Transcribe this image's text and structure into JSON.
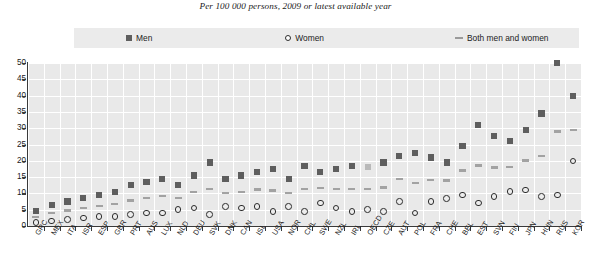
{
  "header": {
    "title": "Suicide rates by gender",
    "subtitle": "Per 100 000 persons, 2009 or latest available year"
  },
  "legend": {
    "men": "Men",
    "women": "Women",
    "both": "Both men and women"
  },
  "colors": {
    "men": "#5e5e5e",
    "men_highlight": "#b9b9b9",
    "women_stroke": "#2b2b2b",
    "both": "#a2a2a2",
    "plot_background": "#e9e9e9",
    "gridline": "#ffffff",
    "axis": "#3a3a3a",
    "legend_background": "#ebebeb"
  },
  "chart_data": {
    "type": "scatter",
    "title": "Suicide rates by gender",
    "subtitle": "Per 100 000 persons, 2009 or latest available year",
    "xlabel": "",
    "ylabel": "",
    "ylim": [
      0,
      50
    ],
    "yticks": [
      0,
      5,
      10,
      15,
      20,
      25,
      30,
      35,
      40,
      45,
      50
    ],
    "grid": true,
    "legend_position": "top",
    "highlight_category": "OECD",
    "categories": [
      "GRC",
      "MEX",
      "ITA",
      "ISR",
      "ESP",
      "GBR",
      "PRT",
      "AUS",
      "LUX",
      "NLD",
      "DEU",
      "SVK",
      "DNK",
      "CAN",
      "ISL",
      "USA",
      "NOR",
      "CHL",
      "SWE",
      "NZL",
      "IRL",
      "OECD",
      "CZE",
      "AUT",
      "POL",
      "FRA",
      "CHE",
      "BEL",
      "EST",
      "SVN",
      "FIN",
      "JPN",
      "HUN",
      "RUS",
      "KOR"
    ],
    "series": [
      {
        "name": "Men",
        "marker": "square",
        "values": [
          4.5,
          6.5,
          7.5,
          8.5,
          9.5,
          10.5,
          12.5,
          13.5,
          14.5,
          12.5,
          15.5,
          19.5,
          14.5,
          15.5,
          16.5,
          17.5,
          14.5,
          18.5,
          16.5,
          17.5,
          18.5,
          18.0,
          19.5,
          21.5,
          22.5,
          21.0,
          19.5,
          24.5,
          31.0,
          27.5,
          26.0,
          29.5,
          34.5,
          50.0,
          40.0
        ]
      },
      {
        "name": "Women",
        "marker": "circle",
        "values": [
          1.0,
          1.5,
          2.0,
          2.5,
          3.0,
          3.0,
          3.5,
          4.0,
          4.0,
          5.0,
          5.5,
          3.5,
          6.0,
          5.5,
          6.0,
          4.5,
          6.0,
          4.5,
          7.0,
          5.5,
          4.5,
          5.0,
          4.5,
          7.5,
          4.0,
          7.5,
          8.5,
          9.5,
          7.0,
          9.0,
          10.5,
          11.0,
          9.0,
          9.5,
          20.0
        ]
      },
      {
        "name": "Both men and women",
        "marker": "dash",
        "values": [
          2.7,
          4.0,
          4.7,
          5.5,
          6.2,
          6.7,
          7.8,
          8.6,
          9.2,
          8.6,
          10.4,
          11.4,
          10.2,
          10.4,
          11.2,
          10.9,
          10.2,
          11.4,
          11.6,
          11.4,
          11.4,
          11.3,
          11.8,
          14.4,
          13.2,
          14.1,
          13.9,
          17.0,
          18.6,
          18.0,
          18.1,
          20.1,
          21.5,
          29.0,
          29.5
        ]
      }
    ]
  }
}
